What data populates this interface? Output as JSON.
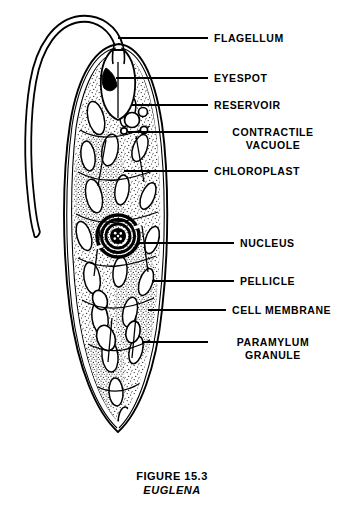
{
  "figure": {
    "caption_number": "FIGURE 15.3",
    "caption_name": "EUGLENA",
    "ink_color": "#000000",
    "background_color": "#ffffff"
  },
  "labels": [
    {
      "id": "flagellum",
      "text": "FLAGELLUM",
      "lines": [
        "FLAGELLUM"
      ],
      "align": "left",
      "text_x": 214,
      "text_y": 32,
      "leader_x1": 118,
      "leader_y1": 38,
      "leader_x2": 208,
      "leader_y2": 38
    },
    {
      "id": "eyespot",
      "text": "EYESPOT",
      "lines": [
        "EYESPOT"
      ],
      "align": "left",
      "text_x": 214,
      "text_y": 72,
      "leader_x1": 116,
      "leader_y1": 78,
      "leader_x2": 208,
      "leader_y2": 78
    },
    {
      "id": "reservoir",
      "text": "RESERVOIR",
      "lines": [
        "RESERVOIR",
        ""
      ],
      "align": "left",
      "text_x": 214,
      "text_y": 99,
      "leader_x1": 132,
      "leader_y1": 105,
      "leader_x2": 208,
      "leader_y2": 105
    },
    {
      "id": "contractile-vacuole",
      "text": "CONTRACTILE VACUOLE",
      "lines": [
        "CONTRACTILE",
        "VACUOLE"
      ],
      "align": "center",
      "text_x": 214,
      "text_y": 126,
      "leader_x1": 128,
      "leader_y1": 132,
      "leader_x2": 208,
      "leader_y2": 132
    },
    {
      "id": "chloroplast",
      "text": "CHLOROPLAST",
      "lines": [
        "CHLOROPLAST"
      ],
      "align": "left",
      "text_x": 214,
      "text_y": 165,
      "leader_x1": 124,
      "leader_y1": 171,
      "leader_x2": 208,
      "leader_y2": 171
    },
    {
      "id": "nucleus",
      "text": "NUCLEUS",
      "lines": [
        "NUCLEUS"
      ],
      "align": "left",
      "text_x": 240,
      "text_y": 237,
      "leader_x1": 138,
      "leader_y1": 243,
      "leader_x2": 234,
      "leader_y2": 243
    },
    {
      "id": "pellicle",
      "text": "PELLICLE",
      "lines": [
        "PELLICLE"
      ],
      "align": "left",
      "text_x": 240,
      "text_y": 275,
      "leader_x1": 152,
      "leader_y1": 281,
      "leader_x2": 234,
      "leader_y2": 281
    },
    {
      "id": "cell-membrane",
      "text": "CELL MEMBRANE",
      "lines": [
        "CELL MEMBRANE"
      ],
      "align": "left",
      "text_x": 232,
      "text_y": 304,
      "leader_x1": 148,
      "leader_y1": 310,
      "leader_x2": 226,
      "leader_y2": 310
    },
    {
      "id": "paramylum-granule",
      "text": "PARAMYLUM GRANULE",
      "lines": [
        "PARAMYLUM",
        "GRANULE"
      ],
      "align": "center",
      "text_x": 214,
      "text_y": 336,
      "leader_x1": 142,
      "leader_y1": 342,
      "leader_x2": 208,
      "leader_y2": 342
    }
  ],
  "organism": {
    "name": "Euglena",
    "structures": [
      {
        "name": "flagellum",
        "description": "long whip-like double-line filament looping up and to the left from anterior opening"
      },
      {
        "name": "eyespot",
        "description": "solid black wedge near anterior reservoir"
      },
      {
        "name": "reservoir",
        "description": "flask-shaped cavity at anterior end"
      },
      {
        "name": "contractile-vacuole",
        "description": "round vacuoles adjacent to the reservoir"
      },
      {
        "name": "chloroplast",
        "description": "numerous elongate oval bodies throughout the cytoplasm"
      },
      {
        "name": "nucleus",
        "description": "concentric ringed body with dotted nucleolus, mid-cell"
      },
      {
        "name": "pellicle",
        "description": "striated outer layer lines along body margin"
      },
      {
        "name": "cell-membrane",
        "description": "outermost boundary line of the cell"
      },
      {
        "name": "paramylum-granule",
        "description": "pale oval storage granules in posterior cytoplasm"
      }
    ]
  }
}
